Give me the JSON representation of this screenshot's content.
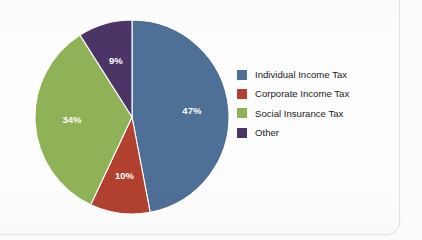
{
  "chart_data": {
    "type": "pie",
    "title": "",
    "categories": [
      "Individual Income Tax",
      "Corporate Income Tax",
      "Social Insurance Tax",
      "Other"
    ],
    "values": [
      47,
      10,
      34,
      9
    ],
    "value_labels": [
      "47%",
      "10%",
      "34%",
      "9%"
    ],
    "colors": [
      "#4e6f96",
      "#b1402f",
      "#8fb257",
      "#4b3566"
    ],
    "units": "percent",
    "start_angle_deg": 0,
    "direction": "clockwise",
    "legend_position": "right",
    "grid": false,
    "data_labels_inside": true,
    "slices": [
      {
        "label": "Individual Income Tax",
        "value": 47,
        "value_label": "47%",
        "color": "#4e6f96"
      },
      {
        "label": "Corporate Income Tax",
        "value": 10,
        "value_label": "10%",
        "color": "#b1402f"
      },
      {
        "label": "Social Insurance Tax",
        "value": 34,
        "value_label": "34%",
        "color": "#8fb257"
      },
      {
        "label": "Other",
        "value": 9,
        "value_label": "9%",
        "color": "#4b3566"
      }
    ]
  },
  "legend": {
    "items": [
      {
        "label": "Individual Income Tax",
        "color": "#4e6f96",
        "swatch_icon": "legend-swatch-icon"
      },
      {
        "label": "Corporate Income Tax",
        "color": "#b1402f",
        "swatch_icon": "legend-swatch-icon"
      },
      {
        "label": "Social Insurance Tax",
        "color": "#8fb257",
        "swatch_icon": "legend-swatch-icon"
      },
      {
        "label": "Other",
        "color": "#4b3566",
        "swatch_icon": "legend-swatch-icon"
      }
    ]
  },
  "page_bleed": {
    "heading_line_1": "Taxation and S",
    "heading_line_2": "in th",
    "body_left": [
      "Taxes",
      "of th",
      "fund",
      "gove"
    ],
    "body_lower": [
      "it is with the govern",
      "the value of an indiv",
      "measure of income"
    ]
  }
}
